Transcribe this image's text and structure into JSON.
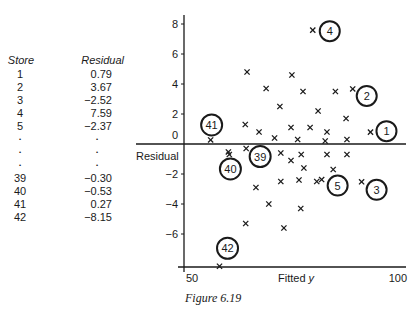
{
  "table": {
    "headers": {
      "store": "Store",
      "residual": "Residual"
    },
    "rows": [
      {
        "store": "1",
        "residual": "0.79"
      },
      {
        "store": "2",
        "residual": "3.67"
      },
      {
        "store": "3",
        "residual": "−2.52"
      },
      {
        "store": "4",
        "residual": "7.59"
      },
      {
        "store": "5",
        "residual": "−2.37"
      },
      {
        "store": "•",
        "residual": "•"
      },
      {
        "store": "•",
        "residual": "•"
      },
      {
        "store": "•",
        "residual": "•"
      },
      {
        "store": "39",
        "residual": "−0.30"
      },
      {
        "store": "40",
        "residual": "−0.53"
      },
      {
        "store": "41",
        "residual": "0.27"
      },
      {
        "store": "42",
        "residual": "−8.15"
      }
    ]
  },
  "caption": "Figure 6.19",
  "chart_data": {
    "type": "scatter",
    "title": "",
    "xlabel": "Fitted y",
    "ylabel": "Residual",
    "xlim": [
      50,
      100
    ],
    "ylim": [
      -8,
      8.5
    ],
    "x_ticks": [
      "50",
      "100"
    ],
    "y_ticks": [
      "8",
      "6",
      "4",
      "2",
      "0",
      "−2",
      "−4",
      "−6"
    ],
    "grid": false,
    "marker": "x",
    "labelled_points": [
      {
        "label": "1",
        "x": 92,
        "y": 0.79
      },
      {
        "label": "2",
        "x": 88,
        "y": 3.67
      },
      {
        "label": "3",
        "x": 90,
        "y": -2.52
      },
      {
        "label": "4",
        "x": 79,
        "y": 7.59
      },
      {
        "label": "5",
        "x": 81,
        "y": -2.37
      },
      {
        "label": "39",
        "x": 64,
        "y": -0.3
      },
      {
        "label": "40",
        "x": 60,
        "y": -0.53
      },
      {
        "label": "41",
        "x": 56,
        "y": 0.27
      },
      {
        "label": "42",
        "x": 58,
        "y": -8.15
      }
    ],
    "points": [
      [
        64.2,
        4.8
      ],
      [
        74.3,
        4.6
      ],
      [
        68.5,
        3.7
      ],
      [
        76.8,
        3.5
      ],
      [
        84.1,
        3.5
      ],
      [
        71.6,
        2.5
      ],
      [
        80.2,
        2.2
      ],
      [
        86.5,
        1.7
      ],
      [
        63.8,
        1.3
      ],
      [
        74.1,
        1.1
      ],
      [
        66.9,
        0.8
      ],
      [
        78.4,
        1.1
      ],
      [
        82.2,
        0.8
      ],
      [
        70.4,
        0.4
      ],
      [
        75.6,
        0.3
      ],
      [
        81.8,
        0.2
      ],
      [
        86.7,
        0.3
      ],
      [
        60.2,
        -0.7
      ],
      [
        74.1,
        -1.1
      ],
      [
        76.4,
        -0.7
      ],
      [
        82.2,
        -0.7
      ],
      [
        86.7,
        -0.7
      ],
      [
        71.8,
        -0.6
      ],
      [
        77.0,
        -1.6
      ],
      [
        83.6,
        -1.7
      ],
      [
        66.2,
        -2.9
      ],
      [
        71.8,
        -2.5
      ],
      [
        75.9,
        -2.4
      ],
      [
        79.9,
        -2.5
      ],
      [
        69.1,
        -4.0
      ],
      [
        76.3,
        -4.3
      ],
      [
        63.9,
        -5.3
      ],
      [
        72.5,
        -5.6
      ]
    ]
  }
}
